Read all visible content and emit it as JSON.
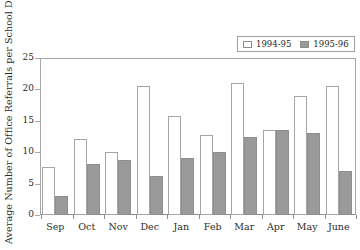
{
  "chart_data": {
    "type": "bar",
    "title": "",
    "subtitle": "",
    "xlabel": "",
    "ylabel": "Average Number of Office Referrals per School Day",
    "categories": [
      "Sep",
      "Oct",
      "Nov",
      "Dec",
      "Jan",
      "Feb",
      "Mar",
      "Apr",
      "May",
      "June"
    ],
    "series": [
      {
        "name": "1994-95",
        "color": "#ffffff",
        "edge_color": "#a5a5a5",
        "values": [
          7.7,
          12.1,
          10.1,
          20.5,
          15.7,
          12.8,
          21.0,
          13.6,
          19.0,
          20.5
        ]
      },
      {
        "name": "1995-96",
        "color": "#9a9a9a",
        "edge_color": "#8e8e8e",
        "values": [
          3.1,
          8.2,
          8.7,
          6.2,
          9.0,
          10.1,
          12.5,
          13.6,
          13.0,
          7.0
        ]
      }
    ],
    "ylim": [
      0,
      25
    ],
    "y_ticks": [
      0,
      5,
      10,
      15,
      20,
      25
    ],
    "y_tick_labels": [
      "0",
      "5",
      "10",
      "15",
      "20",
      "25"
    ],
    "grid": false,
    "legend_position": "top-right",
    "frame": true
  }
}
